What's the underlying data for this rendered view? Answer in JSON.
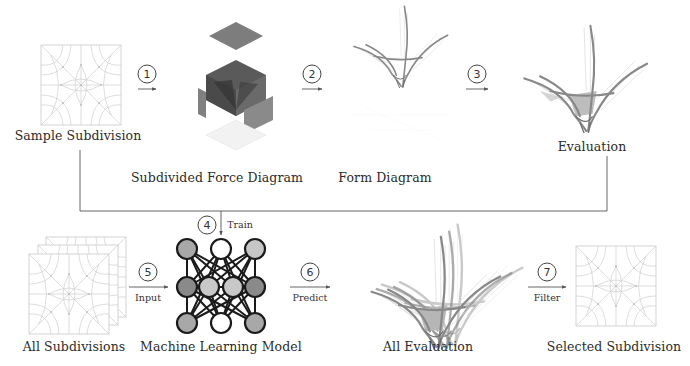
{
  "top_row": {
    "sample_subdivision": {
      "label": "Sample Subdivision"
    },
    "force_diagram": {
      "label": "Subdivided Force Diagram"
    },
    "form_diagram": {
      "label": "Form Diagram"
    },
    "evaluation": {
      "label": "Evaluation"
    }
  },
  "bottom_row": {
    "all_subdivisions": {
      "label": "All Subdivisions"
    },
    "ml_model": {
      "label": "Machine Learning Model"
    },
    "all_evaluation": {
      "label": "All Evaluation"
    },
    "selected_subdivision": {
      "label": "Selected Subdivision"
    }
  },
  "steps": [
    {
      "number": "1",
      "action": ""
    },
    {
      "number": "2",
      "action": ""
    },
    {
      "number": "3",
      "action": ""
    },
    {
      "number": "4",
      "action": "Train"
    },
    {
      "number": "5",
      "action": "Input"
    },
    {
      "number": "6",
      "action": "Predict"
    },
    {
      "number": "7",
      "action": "Filter"
    }
  ],
  "colors": {
    "line": "#555555",
    "grid": "#c8c8c8",
    "node_dark": "#8a8a8a",
    "node_light": "#c4c4c4",
    "force_gray": "#7a7a7a"
  }
}
